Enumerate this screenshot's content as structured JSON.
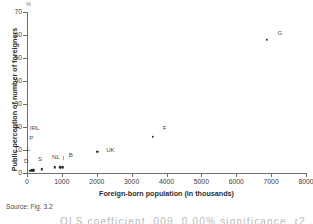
{
  "chart_data": {
    "type": "scatter",
    "title": "",
    "xlabel": "Foreign-born population (in thousands)",
    "ylabel": "Public perception of number of foreigners",
    "unit_marker": "%",
    "xlim": [
      0,
      8000
    ],
    "ylim": [
      0,
      70
    ],
    "xticks": [
      0,
      1000,
      2000,
      3000,
      4000,
      5000,
      6000,
      7000,
      8000
    ],
    "xtick_labels": [
      "0",
      "1000",
      "2000",
      "3000",
      "4000",
      "5000",
      "6000",
      "7000",
      "8000"
    ],
    "yticks": [
      0,
      10,
      20,
      30,
      40,
      50,
      60,
      70
    ],
    "ytick_labels": [
      "0",
      "10",
      "20",
      "30",
      "40",
      "50",
      "60",
      "70"
    ],
    "grid": false,
    "legend": "none",
    "points": [
      {
        "label": "D",
        "x": 90,
        "y": 1.0,
        "label_dx": -4,
        "label_dy": -11
      },
      {
        "label": "L",
        "x": 130,
        "y": 1.2,
        "label_dx": -3,
        "label_dy": -22
      },
      {
        "label": "IRL",
        "x": 160,
        "y": 1.0,
        "label_dx": 2,
        "label_dy": -44
      },
      {
        "label": "P",
        "x": 185,
        "y": 1.1,
        "label_dx": -2,
        "label_dy": -33
      },
      {
        "label": "S",
        "x": 430,
        "y": 1.6,
        "label_dx": -2,
        "label_dy": -11
      },
      {
        "label": "NL",
        "x": 800,
        "y": 2.5,
        "label_dx": 1,
        "label_dy": -11
      },
      {
        "label": "I",
        "x": 960,
        "y": 2.5,
        "label_dx": 3,
        "label_dy": -10
      },
      {
        "label": "B",
        "x": 1030,
        "y": 2.5,
        "label_dx": 8,
        "label_dy": -13
      },
      {
        "label": "UK",
        "x": 2020,
        "y": 9.2,
        "label_dx": 13,
        "label_dy": -3
      },
      {
        "label": "F",
        "x": 3600,
        "y": 15.8,
        "label_dx": 12,
        "label_dy": -10
      },
      {
        "label": "G",
        "x": 6880,
        "y": 57.8,
        "label_dx": 13,
        "label_dy": -8
      }
    ]
  },
  "footer": {
    "source": "Source: Fig. 3.2",
    "cutoff_text": "OLS coefficient .009, 0.00% significance, r2 .92"
  },
  "colors": {
    "point": "#2b2b2b",
    "axis": "#6f6f6f",
    "text": "#3c3c3c",
    "background": "#ffffff"
  }
}
